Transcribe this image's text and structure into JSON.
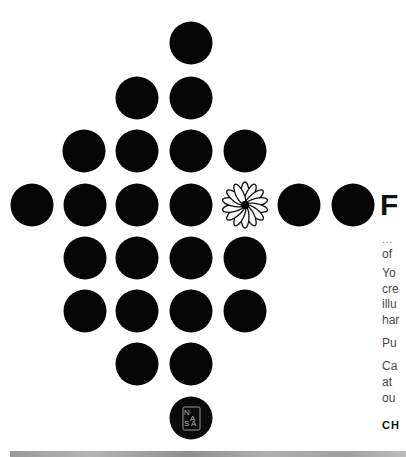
{
  "poster": {
    "dots": [
      {
        "x": 191,
        "y": 43
      },
      {
        "x": 137,
        "y": 98
      },
      {
        "x": 191,
        "y": 98
      },
      {
        "x": 84,
        "y": 151
      },
      {
        "x": 137,
        "y": 151
      },
      {
        "x": 191,
        "y": 151
      },
      {
        "x": 245,
        "y": 151
      },
      {
        "x": 32,
        "y": 205
      },
      {
        "x": 85,
        "y": 205
      },
      {
        "x": 137,
        "y": 205
      },
      {
        "x": 191,
        "y": 205
      },
      {
        "x": 299,
        "y": 205
      },
      {
        "x": 353,
        "y": 205
      },
      {
        "x": 85,
        "y": 258
      },
      {
        "x": 137,
        "y": 258
      },
      {
        "x": 191,
        "y": 258
      },
      {
        "x": 245,
        "y": 258
      },
      {
        "x": 85,
        "y": 311
      },
      {
        "x": 137,
        "y": 311
      },
      {
        "x": 191,
        "y": 311
      },
      {
        "x": 245,
        "y": 311
      },
      {
        "x": 137,
        "y": 364
      },
      {
        "x": 191,
        "y": 364
      }
    ],
    "flower": {
      "x": 245,
      "y": 205,
      "icon": "daisy-flower-icon"
    },
    "nasa_logo": {
      "x": 191,
      "y": 418,
      "letters": [
        "N",
        "A",
        "S",
        "A"
      ]
    },
    "dot_color": "#050505"
  },
  "text": {
    "headline": "F",
    "ellipsis": "...",
    "lines": [
      {
        "text": "of",
        "top": 247
      },
      {
        "text": "Yo",
        "top": 266
      },
      {
        "text": "cre",
        "top": 282
      },
      {
        "text": "illu",
        "top": 297
      },
      {
        "text": "har",
        "top": 313
      },
      {
        "text": "Pu",
        "top": 336
      },
      {
        "text": "Ca",
        "top": 359
      },
      {
        "text": "at",
        "top": 375
      },
      {
        "text": "ou",
        "top": 391
      }
    ],
    "cta": "CH"
  }
}
